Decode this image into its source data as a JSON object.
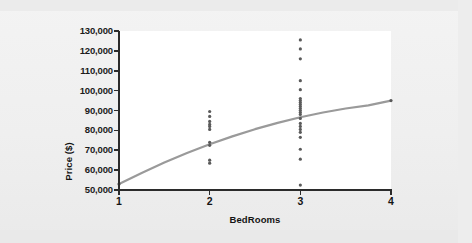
{
  "chart_data": {
    "type": "scatter",
    "title": "",
    "subtitle": "",
    "xlabel": "BedRooms",
    "ylabel": "Price ($)",
    "xlim": [
      1,
      4
    ],
    "ylim": [
      50000,
      130000
    ],
    "grid": false,
    "legend": null,
    "x_ticks": [
      1,
      2,
      3,
      4
    ],
    "x_tick_labels": [
      "1",
      "2",
      "3",
      "4"
    ],
    "y_ticks": [
      50000,
      60000,
      70000,
      80000,
      90000,
      100000,
      110000,
      120000,
      130000
    ],
    "y_tick_labels": [
      "50,000",
      "60,000",
      "70,000",
      "80,000",
      "90,000",
      "100,000",
      "110,000",
      "120,000",
      "130,000"
    ],
    "marker": {
      "shape": "circle",
      "color": "#5a5a5a",
      "size_px": 3.2
    },
    "points": [
      {
        "x": 1,
        "y": 53000
      },
      {
        "x": 2,
        "y": 89500
      },
      {
        "x": 2,
        "y": 87000
      },
      {
        "x": 2,
        "y": 84500
      },
      {
        "x": 2,
        "y": 83000
      },
      {
        "x": 2,
        "y": 82000
      },
      {
        "x": 2,
        "y": 80500
      },
      {
        "x": 2,
        "y": 74000
      },
      {
        "x": 2,
        "y": 72500
      },
      {
        "x": 2,
        "y": 65000
      },
      {
        "x": 2,
        "y": 63500
      },
      {
        "x": 3,
        "y": 125500
      },
      {
        "x": 3,
        "y": 121000
      },
      {
        "x": 3,
        "y": 116000
      },
      {
        "x": 3,
        "y": 105000
      },
      {
        "x": 3,
        "y": 100500
      },
      {
        "x": 3,
        "y": 96000
      },
      {
        "x": 3,
        "y": 95000
      },
      {
        "x": 3,
        "y": 94000
      },
      {
        "x": 3,
        "y": 93000
      },
      {
        "x": 3,
        "y": 92000
      },
      {
        "x": 3,
        "y": 91000
      },
      {
        "x": 3,
        "y": 90000
      },
      {
        "x": 3,
        "y": 89000
      },
      {
        "x": 3,
        "y": 88000
      },
      {
        "x": 3,
        "y": 86000
      },
      {
        "x": 3,
        "y": 83500
      },
      {
        "x": 3,
        "y": 82000
      },
      {
        "x": 3,
        "y": 80500
      },
      {
        "x": 3,
        "y": 79000
      },
      {
        "x": 3,
        "y": 76500
      },
      {
        "x": 3,
        "y": 70500
      },
      {
        "x": 3,
        "y": 65500
      },
      {
        "x": 3,
        "y": 52500
      },
      {
        "x": 4,
        "y": 95000
      }
    ],
    "fit_curve": {
      "name": "fitted curve",
      "color": "#9a9a9a",
      "width_px": 2.2,
      "x": [
        1.0,
        1.25,
        1.5,
        1.75,
        2.0,
        2.25,
        2.5,
        2.75,
        3.0,
        3.25,
        3.5,
        3.75,
        4.0
      ],
      "y": [
        53000,
        58600,
        63800,
        68600,
        73000,
        77000,
        80600,
        83800,
        86600,
        89000,
        91000,
        92600,
        95000
      ]
    }
  },
  "axes": {
    "axis_color": "#2b2b2b",
    "panel_color": "#ffffff",
    "page_color": "#f0f0f0"
  }
}
